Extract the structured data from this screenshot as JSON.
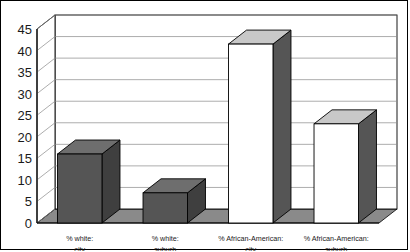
{
  "chart_data": {
    "type": "bar",
    "title": "",
    "subtitle": "",
    "xlabel": "",
    "ylabel": "",
    "categories": [
      "% white: city",
      "% white: suburb",
      "% African-American: city",
      "% African-American: suburb"
    ],
    "category_lines": [
      [
        "% white:",
        "city"
      ],
      [
        "% white:",
        "suburb"
      ],
      [
        "% African-American:",
        "city"
      ],
      [
        "% African-American:",
        "suburb"
      ]
    ],
    "values": [
      16,
      7,
      41.5,
      23
    ],
    "ylim": [
      0,
      45
    ],
    "yticks": [
      0,
      5,
      10,
      15,
      20,
      25,
      30,
      35,
      40,
      45
    ],
    "ytick_labels": [
      "0",
      "5",
      "10",
      "15",
      "20",
      "25",
      "30",
      "35",
      "40",
      "45"
    ],
    "grid": true,
    "legend": "none",
    "style": "3d-columns",
    "bar_styles": [
      "dark",
      "dark",
      "white",
      "white"
    ],
    "annotations": []
  },
  "colors": {
    "bar_dark_front": "#555555",
    "bar_dark_top": "#6e6e6e",
    "bar_dark_side": "#3f3f3f",
    "bar_white_front": "#ffffff",
    "bar_white_top": "#c8c8c8",
    "bar_white_side": "#555555",
    "floor": "#8a8a8a",
    "wall": "#ffffff",
    "gridline": "#8a8a8a",
    "axis": "#000000",
    "text": "#1a1a1a",
    "frame": "#000000"
  }
}
